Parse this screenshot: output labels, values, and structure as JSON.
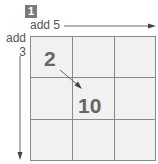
{
  "step": {
    "number": "1"
  },
  "labels": {
    "horizontal": "add 5",
    "vertical_line1": "add",
    "vertical_line2": "3"
  },
  "grid": {
    "rows": 3,
    "columns": 3,
    "cells": [
      [
        "2",
        "",
        ""
      ],
      [
        "",
        "10",
        ""
      ],
      [
        "",
        "",
        ""
      ]
    ]
  },
  "colors": {
    "badge": "#7a7a7a",
    "grid_fill": "#f1f1f1",
    "grid_line": "#8a8a8a",
    "text": "#555555"
  }
}
